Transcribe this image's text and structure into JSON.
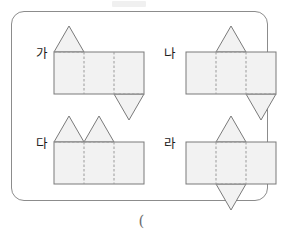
{
  "page": {
    "background_color": "#ffffff",
    "panel_border_color": "#8c8c8c",
    "face_fill_color": "#f2f2f2",
    "edge_color": "#7a7a7a",
    "fold_line_color": "#9a9a9a",
    "answer_paren": "("
  },
  "chart_data": {
    "type": "diagram",
    "title": "",
    "description_items": [
      "net-ga",
      "net-na",
      "net-da",
      "net-ra"
    ]
  },
  "nets": [
    {
      "id": "ga",
      "label": "가",
      "panel_count": 3,
      "panel_width": 30,
      "panel_height": 42,
      "triangle_height": 26,
      "triangles_up": [
        0
      ],
      "triangles_down": [
        2
      ],
      "label_x": 8,
      "label_y": 22,
      "origin_x": 26,
      "origin_y": 26,
      "cell_left": 16,
      "cell_top": 14
    },
    {
      "id": "na",
      "label": "나",
      "panel_count": 3,
      "panel_width": 30,
      "panel_height": 42,
      "triangle_height": 26,
      "triangles_up": [
        1
      ],
      "triangles_down": [
        2
      ],
      "label_x": 4,
      "label_y": 22,
      "origin_x": 26,
      "origin_y": 26,
      "cell_left": 148,
      "cell_top": 14
    },
    {
      "id": "da",
      "label": "다",
      "panel_count": 3,
      "panel_width": 30,
      "panel_height": 42,
      "triangle_height": 26,
      "triangles_up": [
        0,
        1
      ],
      "triangles_down": [],
      "label_x": 8,
      "label_y": 22,
      "origin_x": 26,
      "origin_y": 26,
      "cell_left": 16,
      "cell_top": 104
    },
    {
      "id": "ra",
      "label": "라",
      "panel_count": 3,
      "panel_width": 30,
      "panel_height": 42,
      "triangle_height": 26,
      "triangles_up": [
        1
      ],
      "triangles_down": [
        1
      ],
      "label_x": 4,
      "label_y": 22,
      "origin_x": 26,
      "origin_y": 26,
      "cell_left": 148,
      "cell_top": 104
    }
  ]
}
